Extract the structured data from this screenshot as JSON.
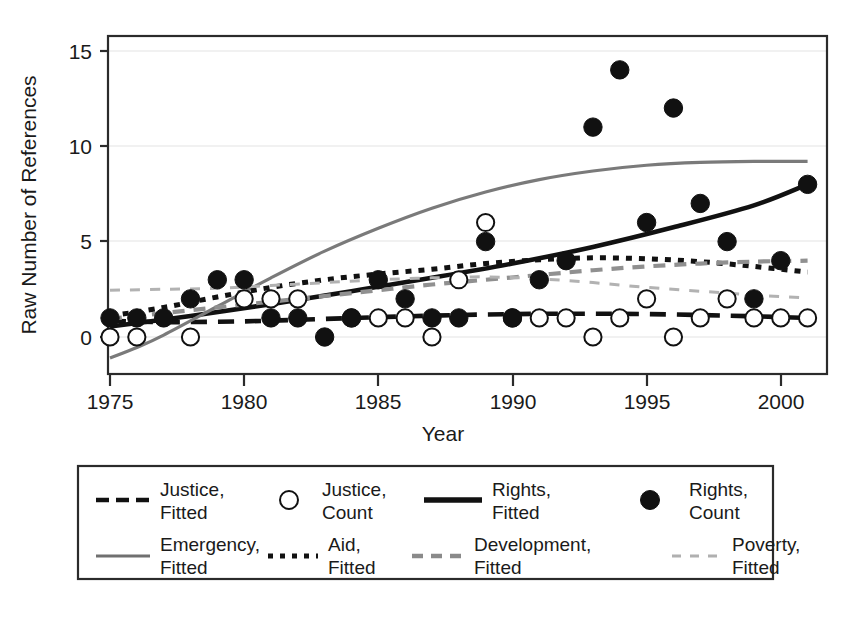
{
  "chart_data": {
    "type": "scatter",
    "title": "",
    "xlabel": "Year",
    "ylabel": "Raw Number of References",
    "xlim": [
      1974.2,
      2001.8
    ],
    "ylim": [
      -1.2,
      15.9
    ],
    "xticks": [
      1975,
      1980,
      1985,
      1990,
      1995,
      2000
    ],
    "yticks": [
      0,
      5,
      10,
      15
    ],
    "grid": "horizontal-light",
    "legend_position": "below-plot",
    "series": [
      {
        "name": "Justice, Count",
        "kind": "points",
        "marker": "open-circle",
        "x": [
          1975,
          1976,
          1978,
          1980,
          1981,
          1982,
          1984,
          1985,
          1986,
          1987,
          1988,
          1989,
          1990,
          1991,
          1992,
          1993,
          1994,
          1995,
          1996,
          1997,
          1998,
          1999,
          2000,
          2001
        ],
        "y": [
          0,
          0,
          0,
          2,
          2,
          2,
          1,
          1,
          1,
          0,
          3,
          6,
          1,
          1,
          1,
          0,
          1,
          2,
          0,
          1,
          2,
          1,
          1,
          1
        ]
      },
      {
        "name": "Rights, Count",
        "kind": "points",
        "marker": "filled-circle",
        "x": [
          1975,
          1976,
          1977,
          1978,
          1979,
          1980,
          1981,
          1982,
          1983,
          1984,
          1985,
          1986,
          1987,
          1988,
          1989,
          1990,
          1991,
          1992,
          1993,
          1994,
          1995,
          1996,
          1997,
          1998,
          1999,
          2000,
          2001
        ],
        "y": [
          1,
          1,
          1,
          2,
          3,
          3,
          1,
          1,
          0,
          1,
          3,
          2,
          1,
          1,
          5,
          1,
          3,
          4,
          11,
          14,
          6,
          12,
          7,
          5,
          2,
          4,
          8
        ]
      },
      {
        "name": "Justice, Fitted",
        "kind": "curve",
        "style": "long-dash",
        "color": "#111111",
        "points": [
          [
            1975,
            0.85
          ],
          [
            1977,
            0.78
          ],
          [
            1980,
            0.82
          ],
          [
            1983,
            0.95
          ],
          [
            1986,
            1.08
          ],
          [
            1989,
            1.18
          ],
          [
            1992,
            1.22
          ],
          [
            1995,
            1.2
          ],
          [
            1998,
            1.12
          ],
          [
            2001,
            1.0
          ]
        ]
      },
      {
        "name": "Rights, Fitted",
        "kind": "curve",
        "style": "solid",
        "color": "#111111",
        "points": [
          [
            1975,
            0.55
          ],
          [
            1978,
            1.1
          ],
          [
            1981,
            1.72
          ],
          [
            1984,
            2.4
          ],
          [
            1987,
            3.1
          ],
          [
            1990,
            3.85
          ],
          [
            1993,
            4.72
          ],
          [
            1996,
            5.75
          ],
          [
            1999,
            6.9
          ],
          [
            2001,
            8.0
          ]
        ]
      },
      {
        "name": "Emergency, Fitted",
        "kind": "curve",
        "style": "solid-gray",
        "color": "#777777",
        "points": [
          [
            1975,
            -1.1
          ],
          [
            1976,
            -0.55
          ],
          [
            1977,
            0.1
          ],
          [
            1979,
            1.6
          ],
          [
            1981,
            3.1
          ],
          [
            1983,
            4.5
          ],
          [
            1985,
            5.7
          ],
          [
            1987,
            6.75
          ],
          [
            1989,
            7.6
          ],
          [
            1991,
            8.25
          ],
          [
            1993,
            8.7
          ],
          [
            1995,
            9.0
          ],
          [
            1997,
            9.15
          ],
          [
            1999,
            9.2
          ],
          [
            2001,
            9.2
          ]
        ]
      },
      {
        "name": "Aid, Fitted",
        "kind": "curve",
        "style": "dotted",
        "color": "#111111",
        "points": [
          [
            1975,
            1.1
          ],
          [
            1977,
            1.55
          ],
          [
            1979,
            2.1
          ],
          [
            1981,
            2.6
          ],
          [
            1983,
            3.0
          ],
          [
            1985,
            3.3
          ],
          [
            1987,
            3.55
          ],
          [
            1989,
            3.85
          ],
          [
            1991,
            4.05
          ],
          [
            1993,
            4.15
          ],
          [
            1995,
            4.1
          ],
          [
            1997,
            3.95
          ],
          [
            1999,
            3.7
          ],
          [
            2001,
            3.4
          ]
        ]
      },
      {
        "name": "Development, Fitted",
        "kind": "curve",
        "style": "dashed-gray",
        "color": "#8a8a8a",
        "points": [
          [
            1975,
            0.95
          ],
          [
            1977,
            1.25
          ],
          [
            1979,
            1.55
          ],
          [
            1981,
            1.85
          ],
          [
            1983,
            2.15
          ],
          [
            1985,
            2.45
          ],
          [
            1987,
            2.75
          ],
          [
            1989,
            3.0
          ],
          [
            1991,
            3.25
          ],
          [
            1993,
            3.5
          ],
          [
            1995,
            3.7
          ],
          [
            1997,
            3.85
          ],
          [
            1999,
            3.95
          ],
          [
            2001,
            4.0
          ]
        ]
      },
      {
        "name": "Poverty, Fitted",
        "kind": "curve",
        "style": "fine-dash-gray",
        "color": "#a8a8a8",
        "points": [
          [
            1975,
            2.45
          ],
          [
            1977,
            2.5
          ],
          [
            1979,
            2.55
          ],
          [
            1981,
            2.7
          ],
          [
            1983,
            2.85
          ],
          [
            1985,
            3.0
          ],
          [
            1987,
            3.1
          ],
          [
            1989,
            3.15
          ],
          [
            1991,
            3.05
          ],
          [
            1993,
            2.85
          ],
          [
            1995,
            2.6
          ],
          [
            1997,
            2.4
          ],
          [
            1999,
            2.2
          ],
          [
            2001,
            2.05
          ]
        ]
      }
    ]
  },
  "axes": {
    "y_title": "Raw Number of References",
    "x_title": "Year",
    "y_tick_labels": [
      "15",
      "10",
      "5",
      "0"
    ],
    "x_tick_labels": [
      "1975",
      "1980",
      "1985",
      "1990",
      "1995",
      "2000"
    ]
  },
  "legend": {
    "rows": [
      [
        {
          "label_line1": "Justice,",
          "label_line2": "Fitted",
          "swatch": "long-dash-swatch"
        },
        {
          "label_line1": "Justice,",
          "label_line2": "Count",
          "swatch": "open-circle-swatch"
        },
        {
          "label_line1": "Rights,",
          "label_line2": "Fitted",
          "swatch": "solid-line-swatch"
        },
        {
          "label_line1": "Rights,",
          "label_line2": "Count",
          "swatch": "filled-circle-swatch"
        }
      ],
      [
        {
          "label_line1": "Emergency,",
          "label_line2": "Fitted",
          "swatch": "gray-solid-swatch"
        },
        {
          "label_line1": "Aid,",
          "label_line2": "Fitted",
          "swatch": "dotted-swatch"
        },
        {
          "label_line1": "Development,",
          "label_line2": "Fitted",
          "swatch": "gray-dash-swatch"
        },
        {
          "label_line1": "Poverty,",
          "label_line2": "Fitted",
          "swatch": "gray-fine-dash-swatch"
        }
      ]
    ]
  },
  "colors": {
    "axis": "#333333",
    "grid": "#e9e9e9",
    "marker_fill": "#111111",
    "marker_open": "#ffffff",
    "emergency": "#777777",
    "development": "#8a8a8a",
    "poverty": "#a8a8a8",
    "background": "#ffffff"
  }
}
